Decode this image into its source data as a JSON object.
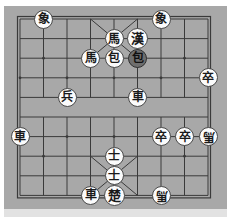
{
  "page": {
    "top_caption": "",
    "board_background_color": "#a8a8a8",
    "line_color": "#3a3a3a",
    "piece_light_fill": "#fbfbfb",
    "piece_dark_fill": "#6e6e6e",
    "piece_text_color": "#1a1a1a",
    "bottom_strip_color": "#e2e2e2"
  },
  "board": {
    "name": "xiangqi-board",
    "files": 9,
    "ranks": 10,
    "origin_x": 16,
    "origin_y": 13,
    "cell_w": 23.5,
    "cell_h": 19.6,
    "river_between_ranks": [
      4,
      5
    ],
    "palace_top": {
      "file_from": 3,
      "file_to": 5,
      "rank_from": 0,
      "rank_to": 2
    },
    "palace_bottom": {
      "file_from": 3,
      "file_to": 5,
      "rank_from": 7,
      "rank_to": 9
    },
    "star_points": [
      {
        "file": 1,
        "rank": 2
      },
      {
        "file": 7,
        "rank": 2
      },
      {
        "file": 0,
        "rank": 3
      },
      {
        "file": 2,
        "rank": 3
      },
      {
        "file": 4,
        "rank": 3
      },
      {
        "file": 6,
        "rank": 3
      },
      {
        "file": 8,
        "rank": 3
      },
      {
        "file": 0,
        "rank": 6
      },
      {
        "file": 2,
        "rank": 6
      },
      {
        "file": 4,
        "rank": 6
      },
      {
        "file": 6,
        "rank": 6
      },
      {
        "file": 8,
        "rank": 6
      },
      {
        "file": 1,
        "rank": 7
      },
      {
        "file": 7,
        "rank": 7
      }
    ]
  },
  "pieces": [
    {
      "id": "p1",
      "glyph": "象",
      "name": "piece-elephant-black-a",
      "side": "black",
      "style": "light",
      "size": "normal",
      "flipped": false,
      "file": 1,
      "rank": 0
    },
    {
      "id": "p2",
      "glyph": "象",
      "name": "piece-elephant-black-b",
      "side": "black",
      "style": "light",
      "size": "normal",
      "flipped": false,
      "file": 6,
      "rank": 0
    },
    {
      "id": "p3",
      "glyph": "馬",
      "name": "piece-horse-black-a",
      "side": "black",
      "style": "light",
      "size": "normal",
      "flipped": false,
      "file": 4,
      "rank": 1
    },
    {
      "id": "p4",
      "glyph": "漢",
      "name": "piece-general-black",
      "side": "black",
      "style": "light",
      "size": "big",
      "flipped": false,
      "file": 5,
      "rank": 1
    },
    {
      "id": "p5",
      "glyph": "馬",
      "name": "piece-horse-black-b",
      "side": "black",
      "style": "light",
      "size": "normal",
      "flipped": false,
      "file": 3,
      "rank": 2
    },
    {
      "id": "p6",
      "glyph": "包",
      "name": "piece-cannon-black-a",
      "side": "black",
      "style": "light",
      "size": "normal",
      "flipped": false,
      "file": 4,
      "rank": 2
    },
    {
      "id": "p7",
      "glyph": "包",
      "name": "piece-cannon-black-b-selected",
      "side": "black",
      "style": "dark",
      "size": "normal",
      "flipped": false,
      "file": 5,
      "rank": 2
    },
    {
      "id": "p8",
      "glyph": "卒",
      "name": "piece-pawn-black-a",
      "side": "black",
      "style": "light",
      "size": "normal",
      "flipped": false,
      "file": 8,
      "rank": 3
    },
    {
      "id": "p9",
      "glyph": "兵",
      "name": "piece-pawn-red-a",
      "side": "red",
      "style": "light",
      "size": "normal",
      "flipped": false,
      "file": 2,
      "rank": 4
    },
    {
      "id": "p10",
      "glyph": "車",
      "name": "piece-chariot-black-a",
      "side": "black",
      "style": "light",
      "size": "normal",
      "flipped": false,
      "file": 5,
      "rank": 4
    },
    {
      "id": "p11",
      "glyph": "車",
      "name": "piece-chariot-black-b",
      "side": "black",
      "style": "light",
      "size": "normal",
      "flipped": false,
      "file": 0,
      "rank": 6
    },
    {
      "id": "p12",
      "glyph": "卒",
      "name": "piece-pawn-black-b",
      "side": "black",
      "style": "light",
      "size": "normal",
      "flipped": false,
      "file": 6,
      "rank": 6
    },
    {
      "id": "p13",
      "glyph": "卒",
      "name": "piece-pawn-black-c",
      "side": "black",
      "style": "light",
      "size": "normal",
      "flipped": false,
      "file": 7,
      "rank": 6
    },
    {
      "id": "p14",
      "glyph": "馬",
      "name": "piece-horse-black-c-flipped",
      "side": "black",
      "style": "light",
      "size": "normal",
      "flipped": true,
      "file": 8,
      "rank": 6
    },
    {
      "id": "p15",
      "glyph": "士",
      "name": "piece-advisor-red-a",
      "side": "red",
      "style": "light",
      "size": "normal",
      "flipped": false,
      "file": 4,
      "rank": 7
    },
    {
      "id": "p16",
      "glyph": "士",
      "name": "piece-advisor-red-b",
      "side": "red",
      "style": "light",
      "size": "normal",
      "flipped": false,
      "file": 4,
      "rank": 8
    },
    {
      "id": "p17",
      "glyph": "車",
      "name": "piece-chariot-red-a",
      "side": "red",
      "style": "light",
      "size": "normal",
      "flipped": false,
      "file": 3,
      "rank": 9
    },
    {
      "id": "p18",
      "glyph": "楚",
      "name": "piece-general-red",
      "side": "red",
      "style": "light",
      "size": "big",
      "flipped": false,
      "file": 4,
      "rank": 9
    },
    {
      "id": "p19",
      "glyph": "馬",
      "name": "piece-horse-red-flipped",
      "side": "red",
      "style": "light",
      "size": "normal",
      "flipped": true,
      "file": 6,
      "rank": 9
    }
  ]
}
